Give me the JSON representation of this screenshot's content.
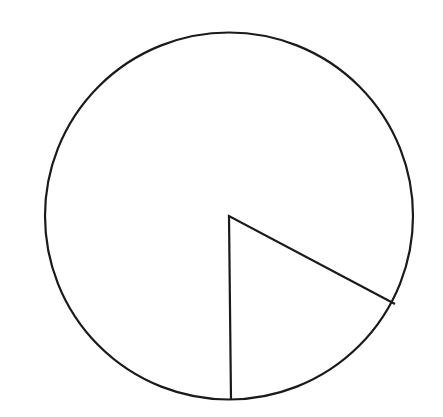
{
  "diagram": {
    "type": "circle-with-sector",
    "background": "#ffffff",
    "stroke_color": "#1a1a1a",
    "stroke_width": 2.2,
    "circle": {
      "cx": 229,
      "cy": 216,
      "rx": 184,
      "ry": 183.5
    },
    "sector": {
      "center": [
        229,
        216
      ],
      "ray_end_1": [
        231,
        400
      ],
      "ray_end_2": [
        395,
        304
      ],
      "approx_angle_deg": 61,
      "approx_fraction_of_circle": 0.17
    },
    "labels": []
  }
}
